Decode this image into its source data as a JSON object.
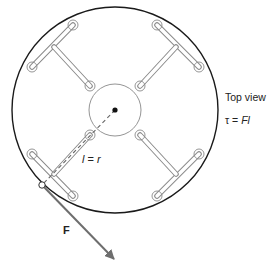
{
  "diagram": {
    "view_label": "Top view",
    "torque_equation": {
      "prefix": "τ = ",
      "rhs": "Fl"
    },
    "radius_label": {
      "l": "l",
      "eq": " = ",
      "r": "r"
    },
    "force_label": "F",
    "colors": {
      "outline": "#1a1a1a",
      "fitting": "#777777",
      "arrow": "#6e6e6e",
      "dashed_line": "#777777"
    },
    "geometry": {
      "outer_circle": {
        "cx": 115,
        "cy": 110,
        "r": 103
      },
      "hub_circle": {
        "cx": 115,
        "cy": 110,
        "r": 26
      },
      "pivot_point": {
        "cx": 115,
        "cy": 110
      },
      "force_application_point": {
        "cx": 42,
        "cy": 185
      },
      "force_arrow_tip": {
        "x": 116,
        "y": 261
      }
    }
  }
}
